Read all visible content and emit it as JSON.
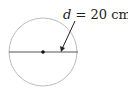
{
  "diagram": {
    "shape": "circle",
    "label_var": "d",
    "label_eq": " = 20 cm",
    "measurement": "diameter",
    "value": 20,
    "unit": "cm",
    "colors": {
      "circle": "#bdbdbd",
      "line": "#555555",
      "text": "#222222"
    }
  }
}
